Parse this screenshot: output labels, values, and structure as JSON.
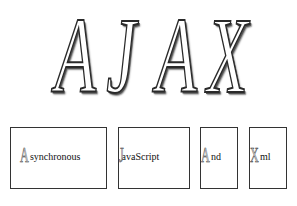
{
  "title": {
    "letters": [
      "A",
      "J",
      "A",
      "X"
    ]
  },
  "acronym_boxes": [
    {
      "initial": "A",
      "rest": "synchronous"
    },
    {
      "initial": "J",
      "rest": "avaScript"
    },
    {
      "initial": "A",
      "rest": "nd"
    },
    {
      "initial": "X",
      "rest": "ml"
    }
  ],
  "colors": {
    "background": "#ffffff",
    "outline": "#2a2a2a",
    "box_border": "#333333"
  }
}
